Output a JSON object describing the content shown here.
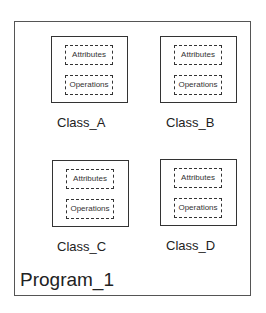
{
  "program": {
    "label": "Program_1"
  },
  "classes": [
    {
      "name": "Class_A",
      "attributes": "Attributes",
      "operations": "Operations"
    },
    {
      "name": "Class_B",
      "attributes": "Attributes",
      "operations": "Operations"
    },
    {
      "name": "Class_C",
      "attributes": "Attributes",
      "operations": "Operations"
    },
    {
      "name": "Class_D",
      "attributes": "Attributes",
      "operations": "Operations"
    }
  ]
}
